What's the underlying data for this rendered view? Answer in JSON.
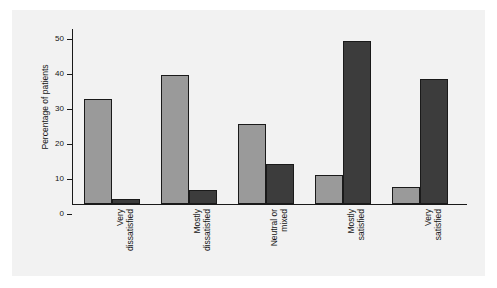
{
  "chart_data": {
    "type": "bar",
    "title": "",
    "xlabel": "",
    "ylabel": "Percentage of patients",
    "ylim": [
      0,
      50
    ],
    "yticks": [
      0,
      10,
      20,
      30,
      40,
      50
    ],
    "ytick_labels": [
      "0",
      "10",
      "20",
      "30",
      "40",
      "50"
    ],
    "grid": false,
    "legend": "none",
    "categories": [
      "Very\ndissatisfied",
      "Mostly\ndissatisfied",
      "Neutral or\nmixed",
      "Mostly\nsatisfied",
      "Very\nsatisfied"
    ],
    "series": [
      {
        "name": "series-1",
        "color": "#9a9a9a",
        "values": [
          30,
          36.8,
          23,
          8.3,
          5
        ]
      },
      {
        "name": "series-2",
        "color": "#3c3c3c",
        "values": [
          1.3,
          4,
          11.5,
          46.5,
          35.8
        ]
      }
    ]
  },
  "figure": {
    "background": "#f2f2f2",
    "page_background": "#ffffff",
    "axis_color": "#1a1a1a"
  }
}
